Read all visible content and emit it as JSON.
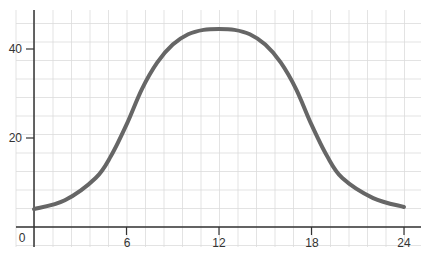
{
  "chart_data": {
    "type": "line",
    "title": "",
    "xlabel": "",
    "ylabel": "",
    "x_ticks": [
      0,
      6,
      12,
      18,
      24
    ],
    "y_ticks": [
      20,
      40
    ],
    "xlim": [
      0,
      24
    ],
    "ylim": [
      0,
      45
    ],
    "grid": true,
    "series": [
      {
        "name": "curve",
        "color": "#666666",
        "x": [
          0,
          2,
          4,
          5,
          6,
          7,
          8,
          9,
          10,
          11,
          12,
          13,
          14,
          15,
          16,
          17,
          18,
          19,
          20,
          22,
          24
        ],
        "y": [
          4,
          6,
          11,
          16,
          23,
          31,
          37,
          41,
          43.3,
          44.3,
          44.5,
          44.3,
          43.3,
          41,
          37,
          31,
          23,
          16,
          11,
          6.5,
          4.5
        ]
      }
    ]
  },
  "labels": {
    "origin": "0",
    "x": [
      "6",
      "12",
      "18",
      "24"
    ],
    "y": [
      "20",
      "40"
    ]
  }
}
